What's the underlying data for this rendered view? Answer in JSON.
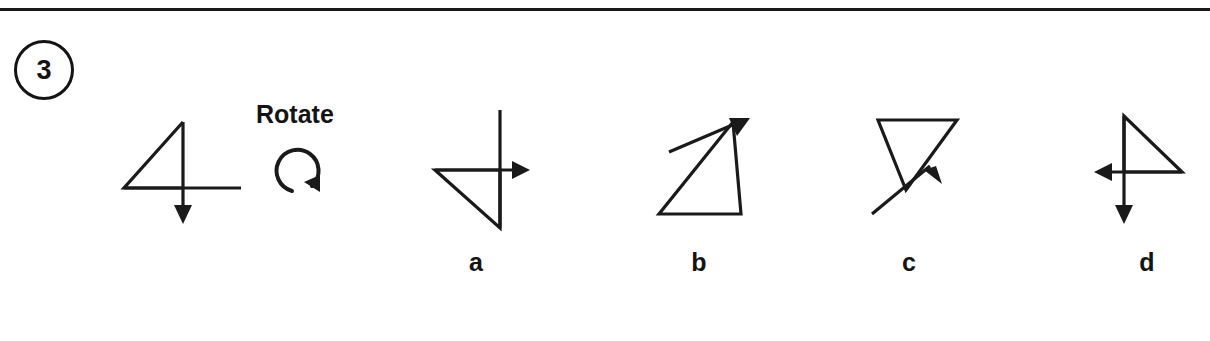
{
  "page": {
    "background_color": "#ffffff",
    "ink_color": "#1a1a1a",
    "divider_present": true
  },
  "item": {
    "number": "3",
    "number_badge_shape": "circle"
  },
  "instruction": {
    "label": "Rotate",
    "icon": "rotate-clockwise-icon",
    "direction": "clockwise"
  },
  "prompt_figure": {
    "name": "prompt-figure",
    "description": "Right triangle with vertical downward arrow and horizontal line"
  },
  "options": [
    {
      "key": "a",
      "label": "a",
      "description": "Triangle rotated with vertical line and rightward arrow"
    },
    {
      "key": "b",
      "label": "b",
      "description": "Triangle with diagonal arrow pointing up-right"
    },
    {
      "key": "c",
      "label": "c",
      "description": "Inverted triangle with diagonal arrow pointing down-right"
    },
    {
      "key": "d",
      "label": "d",
      "description": "Mirrored triangle with leftward arrow and downward arrow"
    }
  ]
}
